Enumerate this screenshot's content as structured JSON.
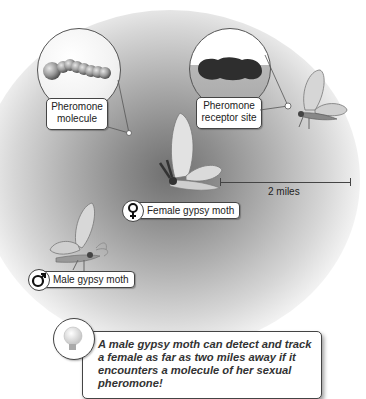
{
  "labels": {
    "pheromone_molecule": [
      "Pheromone",
      "molecule"
    ],
    "receptor_site": [
      "Pheromone",
      "receptor site"
    ],
    "female": "Female gypsy moth",
    "male": "Male gypsy moth",
    "distance": "2 miles"
  },
  "note": {
    "icon": "lightbulb-icon",
    "text": "A male gypsy moth can detect and track a female as far as two miles away if it encounters a molecule of her sexual pheromone!"
  },
  "symbols": {
    "female": "♀",
    "male": "♂"
  },
  "colors": {
    "background": "#ffffff",
    "glow_center": "#6f6f6f",
    "molecule": "#9a9a9a",
    "receptor": "#333333",
    "moth_wing": "#d8d8d8"
  }
}
